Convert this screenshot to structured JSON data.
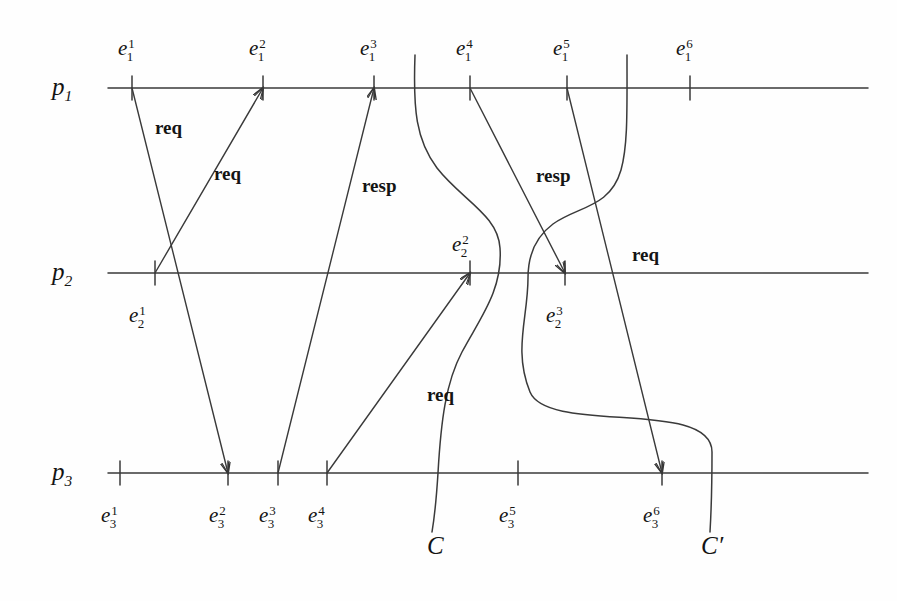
{
  "figure": {
    "kind": "space-time-diagram",
    "width": 897,
    "height": 601,
    "background_color": "#fefefe",
    "stroke_color": "#3a3a3a",
    "text_color": "#141414"
  },
  "processes": [
    {
      "id": "p1",
      "label": "p",
      "index": "1",
      "label_x": 52,
      "label_y": 74,
      "line_y": 88,
      "line_x1": 108,
      "line_x2": 868
    },
    {
      "id": "p2",
      "label": "p",
      "index": "2",
      "label_x": 52,
      "label_y": 259,
      "line_y": 273,
      "line_x1": 108,
      "line_x2": 868
    },
    {
      "id": "p3",
      "label": "p",
      "index": "3",
      "label_x": 52,
      "label_y": 459,
      "line_y": 473,
      "line_x1": 108,
      "line_x2": 868
    }
  ],
  "events": [
    {
      "name": "e_1_1",
      "base": "e",
      "sup": "1",
      "sub": "1",
      "x": 132,
      "line_y": 88,
      "label_x": 118,
      "label_y": 36,
      "tick_above": 12,
      "tick_below": 12
    },
    {
      "name": "e_1_2",
      "base": "e",
      "sup": "2",
      "sub": "1",
      "x": 263,
      "line_y": 88,
      "label_x": 249,
      "label_y": 36,
      "tick_above": 12,
      "tick_below": 12
    },
    {
      "name": "e_1_3",
      "base": "e",
      "sup": "3",
      "sub": "1",
      "x": 374,
      "line_y": 88,
      "label_x": 360,
      "label_y": 36,
      "tick_above": 12,
      "tick_below": 12
    },
    {
      "name": "e_1_4",
      "base": "e",
      "sup": "4",
      "sub": "1",
      "x": 470,
      "line_y": 88,
      "label_x": 456,
      "label_y": 36,
      "tick_above": 12,
      "tick_below": 12
    },
    {
      "name": "e_1_5",
      "base": "e",
      "sup": "5",
      "sub": "1",
      "x": 567,
      "line_y": 88,
      "label_x": 553,
      "label_y": 36,
      "tick_above": 12,
      "tick_below": 12
    },
    {
      "name": "e_1_6",
      "base": "e",
      "sup": "6",
      "sub": "1",
      "x": 690,
      "line_y": 88,
      "label_x": 676,
      "label_y": 36,
      "tick_above": 12,
      "tick_below": 12
    },
    {
      "name": "e_2_1",
      "base": "e",
      "sup": "1",
      "sub": "2",
      "x": 155,
      "line_y": 273,
      "label_x": 129,
      "label_y": 303,
      "tick_above": 12,
      "tick_below": 12
    },
    {
      "name": "e_2_2",
      "base": "e",
      "sup": "2",
      "sub": "2",
      "x": 470,
      "line_y": 273,
      "label_x": 452,
      "label_y": 232,
      "tick_above": 12,
      "tick_below": 12
    },
    {
      "name": "e_2_3",
      "base": "e",
      "sup": "3",
      "sub": "2",
      "x": 565,
      "line_y": 273,
      "label_x": 546,
      "label_y": 303,
      "tick_above": 12,
      "tick_below": 12
    },
    {
      "name": "e_3_1",
      "base": "e",
      "sup": "1",
      "sub": "3",
      "x": 120,
      "line_y": 473,
      "label_x": 101,
      "label_y": 503,
      "tick_above": 12,
      "tick_below": 12
    },
    {
      "name": "e_3_2",
      "base": "e",
      "sup": "2",
      "sub": "3",
      "x": 228,
      "line_y": 473,
      "label_x": 209,
      "label_y": 503,
      "tick_above": 12,
      "tick_below": 12
    },
    {
      "name": "e_3_3",
      "base": "e",
      "sup": "3",
      "sub": "3",
      "x": 278,
      "line_y": 473,
      "label_x": 259,
      "label_y": 503,
      "tick_above": 12,
      "tick_below": 12
    },
    {
      "name": "e_3_4",
      "base": "e",
      "sup": "4",
      "sub": "3",
      "x": 327,
      "line_y": 473,
      "label_x": 308,
      "label_y": 503,
      "tick_above": 12,
      "tick_below": 12
    },
    {
      "name": "e_3_5",
      "base": "e",
      "sup": "5",
      "sub": "3",
      "x": 518,
      "line_y": 473,
      "label_x": 499,
      "label_y": 503,
      "tick_above": 12,
      "tick_below": 12
    },
    {
      "name": "e_3_6",
      "base": "e",
      "sup": "6",
      "sub": "3",
      "x": 662,
      "line_y": 473,
      "label_x": 643,
      "label_y": 503,
      "tick_above": 12,
      "tick_below": 12
    }
  ],
  "messages": [
    {
      "id": "m1",
      "label": "req",
      "from": "e_1_1",
      "to": "e_3_2",
      "x1": 132,
      "y1": 88,
      "x2": 228,
      "y2": 473,
      "label_x": 155,
      "label_y": 118,
      "arrowhead": "end"
    },
    {
      "id": "m2",
      "label": "req",
      "from": "e_2_1",
      "to": "e_1_2",
      "x1": 155,
      "y1": 273,
      "x2": 263,
      "y2": 88,
      "label_x": 214,
      "label_y": 164,
      "arrowhead": "end"
    },
    {
      "id": "m3",
      "label": "resp",
      "from": "e_3_3",
      "to": "e_1_3",
      "x1": 278,
      "y1": 473,
      "x2": 374,
      "y2": 88,
      "label_x": 362,
      "label_y": 176,
      "arrowhead": "end"
    },
    {
      "id": "m4",
      "label": "req",
      "from": "e_3_4",
      "to": "e_2_2",
      "x1": 327,
      "y1": 473,
      "x2": 470,
      "y2": 273,
      "label_x": 427,
      "label_y": 385,
      "arrowhead": "end"
    },
    {
      "id": "m5",
      "label": "resp",
      "from": "e_1_4",
      "to": "e_2_3",
      "x1": 470,
      "y1": 88,
      "x2": 565,
      "y2": 273,
      "label_x": 536,
      "label_y": 166,
      "arrowhead": "end"
    },
    {
      "id": "m6",
      "label": "req",
      "from": "e_1_5",
      "to": "e_3_6",
      "x1": 567,
      "y1": 88,
      "x2": 662,
      "y2": 473,
      "label_x": 632,
      "label_y": 245,
      "arrowhead": "end"
    }
  ],
  "cuts": [
    {
      "id": "C",
      "label": "C",
      "label_x": 427,
      "label_y": 533,
      "path": "M 415,55 C 413,110 416,140 437,168 C 462,200 498,215 500,248 C 503,290 480,318 462,352 C 446,382 441,420 438,473 C 436,505 434,520 432,532"
    },
    {
      "id": "Cprime",
      "label": "C′",
      "label_x": 701,
      "label_y": 533,
      "path": "M 627,55 C 627,110 628,145 621,170 C 610,208 578,206 553,224 C 534,238 528,258 528,278 C 528,318 513,350 530,392 C 548,435 712,398 712,452 C 712,492 711,515 710,532"
    }
  ]
}
